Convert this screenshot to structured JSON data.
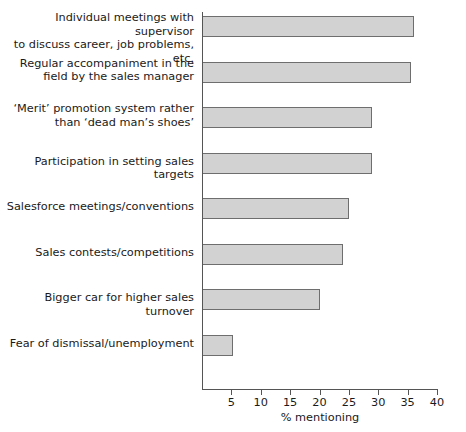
{
  "chart_data": {
    "type": "bar",
    "orientation": "horizontal",
    "title": "",
    "xlabel": "% mentioning",
    "ylabel": "",
    "xlim": [
      0,
      40
    ],
    "xticks": [
      5,
      10,
      15,
      20,
      25,
      30,
      35,
      40
    ],
    "grid": false,
    "legend": null,
    "bar_color": "#d2d2d2",
    "bar_border_color": "#6e6e6e",
    "axis_color": "#555555",
    "categories": [
      "Individual meetings with supervisor\nto discuss career, job problems, etc.",
      "Regular accompaniment in the\nfield by the sales manager",
      "‘Merit’ promotion system rather\nthan ‘dead man’s shoes’",
      "Participation in setting sales targets",
      "Salesforce meetings/conventions",
      "Sales contests/competitions",
      "Bigger car for higher sales turnover",
      "Fear of dismissal/unemployment"
    ],
    "values": [
      36,
      35.5,
      29,
      29,
      25,
      24,
      20,
      5.3
    ]
  }
}
